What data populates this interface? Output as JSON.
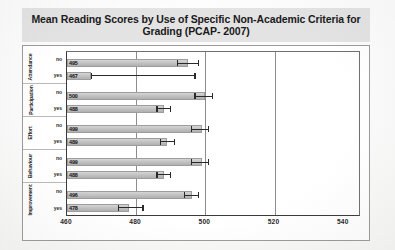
{
  "chart_data": {
    "type": "bar",
    "orientation": "horizontal",
    "title": "Mean Reading Scores by Use of Specific Non-Academic Criteria for Grading (PCAP- 2007)",
    "xlabel": "",
    "ylabel": "",
    "xlim": [
      460,
      545
    ],
    "xticks": [
      460,
      480,
      500,
      520,
      540
    ],
    "gridlines": [
      480,
      500,
      520
    ],
    "grid": true,
    "legend": "none",
    "categories": [
      "Attendance",
      "Participation",
      "Effort",
      "Behaviour",
      "Improvement"
    ],
    "series": [
      {
        "name": "no",
        "values": [
          495,
          500,
          499,
          499,
          496
        ]
      },
      {
        "name": "yes",
        "values": [
          467,
          488,
          489,
          488,
          478
        ]
      }
    ],
    "groups": [
      {
        "label": "Attendance",
        "bars": [
          {
            "response": "no",
            "value": 495,
            "err_low": 492,
            "err_high": 498
          },
          {
            "response": "yes",
            "value": 467,
            "err_low": 467,
            "err_high": 497
          }
        ]
      },
      {
        "label": "Participation",
        "bars": [
          {
            "response": "no",
            "value": 500,
            "err_low": 497,
            "err_high": 502
          },
          {
            "response": "yes",
            "value": 488,
            "err_low": 486,
            "err_high": 490
          }
        ]
      },
      {
        "label": "Effort",
        "bars": [
          {
            "response": "no",
            "value": 499,
            "err_low": 496,
            "err_high": 501
          },
          {
            "response": "yes",
            "value": 489,
            "err_low": 487,
            "err_high": 491
          }
        ]
      },
      {
        "label": "Behaviour",
        "bars": [
          {
            "response": "no",
            "value": 499,
            "err_low": 496,
            "err_high": 501
          },
          {
            "response": "yes",
            "value": 488,
            "err_low": 486,
            "err_high": 490
          }
        ]
      },
      {
        "label": "Improvement",
        "bars": [
          {
            "response": "no",
            "value": 496,
            "err_low": 494,
            "err_high": 498
          },
          {
            "response": "yes",
            "value": 478,
            "err_low": 475,
            "err_high": 482
          }
        ]
      }
    ]
  },
  "colors": {
    "title_band": "#e3e3e3",
    "bar_fill": "#c3c3c3",
    "bar_border": "#9d9d9d",
    "axis": "#3a3a3a",
    "gridline": "#8d8d8d",
    "error_bar": "#2a2a2a",
    "text": "#1a1a1a"
  }
}
